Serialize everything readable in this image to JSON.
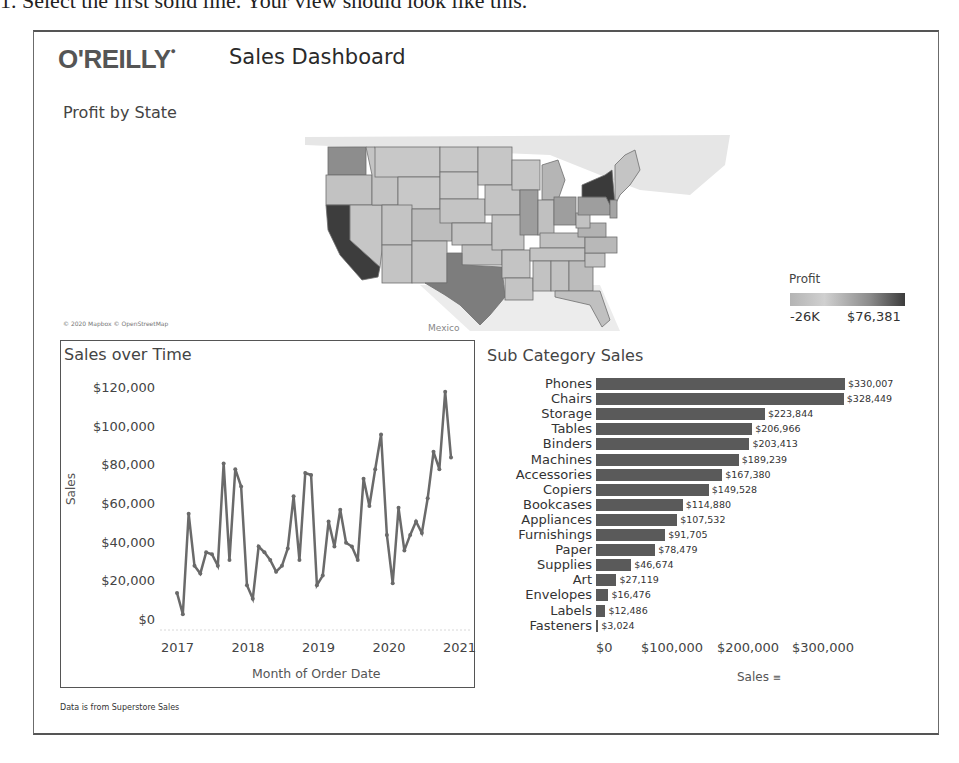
{
  "caption": "1. Select the first solid line. Your view should look like this.",
  "header": {
    "logo": "O'REILLY",
    "title": "Sales Dashboard"
  },
  "map": {
    "title": "Profit by State",
    "attribution": "© 2020 Mapbox © OpenStreetMap",
    "country_label": "Mexico",
    "legend": {
      "title": "Profit",
      "min": "-26K",
      "max": "$76,381"
    },
    "colors": {
      "low": "#c8c8c8",
      "mid": "#9a9a9a",
      "high": "#3c3c3c",
      "base": "#bdbdbd"
    }
  },
  "footer": "Data is from Superstore Sales",
  "chart_data": [
    {
      "type": "line",
      "title": "Sales over Time",
      "xlabel": "Month of Order Date",
      "ylabel": "Sales",
      "ylim": [
        0,
        120000
      ],
      "yticks": [
        "$120,000",
        "$100,000",
        "$80,000",
        "$60,000",
        "$40,000",
        "$20,000",
        "$0"
      ],
      "xticks": [
        "2017",
        "2018",
        "2019",
        "2020",
        "2021"
      ],
      "grid": false,
      "x": [
        "2017-01",
        "2017-02",
        "2017-03",
        "2017-04",
        "2017-05",
        "2017-06",
        "2017-07",
        "2017-08",
        "2017-09",
        "2017-10",
        "2017-11",
        "2017-12",
        "2018-01",
        "2018-02",
        "2018-03",
        "2018-04",
        "2018-05",
        "2018-06",
        "2018-07",
        "2018-08",
        "2018-09",
        "2018-10",
        "2018-11",
        "2018-12",
        "2019-01",
        "2019-02",
        "2019-03",
        "2019-04",
        "2019-05",
        "2019-06",
        "2019-07",
        "2019-08",
        "2019-09",
        "2019-10",
        "2019-11",
        "2019-12",
        "2020-01",
        "2020-02",
        "2020-03",
        "2020-04",
        "2020-05",
        "2020-06",
        "2020-07",
        "2020-08",
        "2020-09",
        "2020-10",
        "2020-11",
        "2020-12"
      ],
      "values": [
        14000,
        3000,
        55000,
        28000,
        24000,
        35000,
        34000,
        28000,
        81000,
        31000,
        78000,
        69000,
        18000,
        11000,
        38000,
        35000,
        31000,
        25000,
        28000,
        37000,
        64000,
        31000,
        76000,
        75000,
        18000,
        23000,
        51000,
        38000,
        57000,
        40000,
        38000,
        31000,
        73000,
        59000,
        78000,
        96000,
        44000,
        19000,
        58000,
        36000,
        44000,
        51000,
        45000,
        63000,
        87000,
        78000,
        118000,
        84000
      ],
      "color": "#6a6a6a"
    },
    {
      "type": "bar",
      "orientation": "horizontal",
      "title": "Sub Category Sales",
      "xlabel": "Sales",
      "xticks": [
        "$0",
        "$100,000",
        "$200,000",
        "$300,000"
      ],
      "xlim": [
        0,
        330007
      ],
      "categories": [
        "Phones",
        "Chairs",
        "Storage",
        "Tables",
        "Binders",
        "Machines",
        "Accessories",
        "Copiers",
        "Bookcases",
        "Appliances",
        "Furnishings",
        "Paper",
        "Supplies",
        "Art",
        "Envelopes",
        "Labels",
        "Fasteners"
      ],
      "values": [
        330007,
        328449,
        223844,
        206966,
        203413,
        189239,
        167380,
        149528,
        114880,
        107532,
        91705,
        78479,
        46674,
        27119,
        16476,
        12486,
        3024
      ],
      "labels": [
        "$330,007",
        "$328,449",
        "$223,844",
        "$206,966",
        "$203,413",
        "$189,239",
        "$167,380",
        "$149,528",
        "$114,880",
        "$107,532",
        "$91,705",
        "$78,479",
        "$46,674",
        "$27,119",
        "$16,476",
        "$12,486",
        "$3,024"
      ],
      "color": "#5a5a5a",
      "sort_icon": "sort-descending-icon"
    }
  ]
}
